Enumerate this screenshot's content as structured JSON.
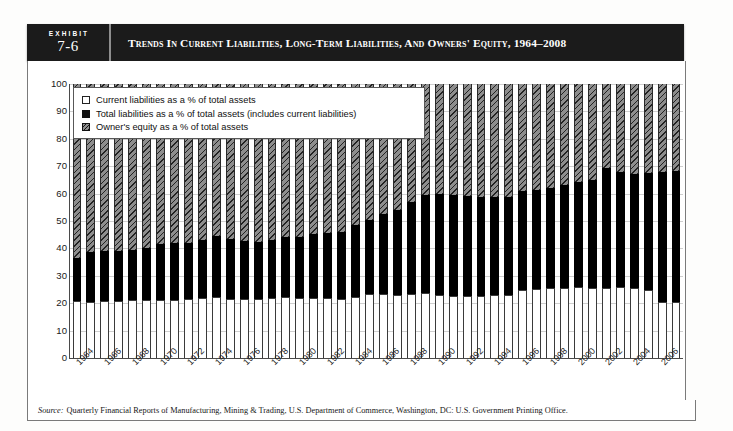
{
  "exhibit": {
    "kicker": "EXHIBIT",
    "number": "7-6",
    "title": "Trends in Current Liabilities, Long-Term Liabilities, and Owners' Equity, 1964–2008"
  },
  "source": {
    "label": "Source:",
    "text": "Quarterly Financial Reports of Manufacturing, Mining & Trading, U.S. Department of Commerce, Washington, DC: U.S. Government Printing Office."
  },
  "legend": {
    "items": [
      {
        "swatch": "white-square-icon",
        "label": "Current liabilities as a % of total assets"
      },
      {
        "swatch": "black-square-icon",
        "label": "Total liabilities as a % of total assets (includes current liabilities)"
      },
      {
        "swatch": "hatched-square-icon",
        "label": "Owner's equity as a % of total assets"
      }
    ]
  },
  "colors": {
    "header_bg": "#1b1b1b",
    "current_liabilities": "#ffffff",
    "total_liabilities": "#000000",
    "owners_equity": "#8d8d8d",
    "gridline": "#cfcfcf",
    "axis": "#4a4a4a"
  },
  "chart_data": {
    "type": "bar",
    "stacked": true,
    "title": "Trends in Current Liabilities, Long-Term Liabilities, and Owners' Equity, 1964–2008",
    "xlabel": "",
    "ylabel": "",
    "ylim": [
      0,
      100
    ],
    "yticks": [
      0,
      10,
      20,
      30,
      40,
      50,
      60,
      70,
      80,
      90,
      100
    ],
    "grid": true,
    "legend_position": "top-left",
    "x": [
      1964,
      1965,
      1966,
      1967,
      1968,
      1969,
      1970,
      1971,
      1972,
      1973,
      1974,
      1975,
      1976,
      1977,
      1978,
      1979,
      1980,
      1981,
      1982,
      1983,
      1984,
      1985,
      1986,
      1987,
      1988,
      1989,
      1990,
      1991,
      1992,
      1993,
      1994,
      1995,
      1996,
      1997,
      1998,
      1999,
      2000,
      2001,
      2002,
      2003,
      2004,
      2005,
      2006,
      2007
    ],
    "xtick_labels": [
      "1964",
      "1966",
      "1968",
      "1970",
      "1972",
      "1974",
      "1976",
      "1978",
      "1980",
      "1982",
      "1984",
      "1986",
      "1988",
      "1990",
      "1992",
      "1994",
      "1996",
      "1998",
      "2000",
      "2002",
      "2004",
      "2006"
    ],
    "series": [
      {
        "name": "Current liabilities as a % of total assets",
        "key": "current_liabilities",
        "values": [
          20.8,
          20.6,
          20.8,
          20.8,
          21.0,
          21.2,
          21.2,
          21.0,
          21.4,
          22.0,
          22.2,
          21.4,
          21.4,
          21.6,
          21.8,
          22.2,
          22.0,
          22.0,
          21.8,
          21.6,
          22.4,
          23.2,
          23.2,
          23.0,
          23.4,
          23.6,
          23.0,
          22.6,
          22.6,
          22.8,
          23.0,
          23.0,
          25.0,
          25.2,
          25.4,
          25.6,
          26.0,
          25.6,
          25.6,
          25.8,
          25.4,
          24.8,
          20.6,
          20.4
        ]
      },
      {
        "name": "Total liabilities as a % of total assets (includes current liabilities)",
        "key": "total_liabilities",
        "values": [
          36.4,
          38.8,
          39.0,
          39.2,
          39.4,
          40.2,
          41.6,
          41.8,
          42.0,
          43.0,
          44.4,
          43.6,
          42.6,
          42.4,
          43.0,
          44.0,
          44.2,
          45.4,
          45.8,
          46.0,
          48.6,
          50.2,
          52.6,
          54.2,
          57.0,
          59.6,
          60.0,
          59.4,
          59.0,
          58.6,
          58.6,
          58.8,
          60.8,
          61.4,
          62.2,
          63.2,
          64.4,
          65.0,
          69.2,
          68.0,
          67.2,
          67.4,
          68.0,
          68.4
        ]
      },
      {
        "name": "Owner's equity as a % of total assets",
        "key": "owners_equity",
        "values": [
          63.6,
          61.2,
          61.0,
          60.8,
          60.6,
          59.8,
          58.4,
          58.2,
          58.0,
          57.0,
          55.6,
          56.4,
          57.4,
          57.6,
          57.0,
          56.0,
          55.8,
          54.6,
          54.2,
          54.0,
          51.4,
          49.8,
          47.4,
          45.8,
          43.0,
          40.4,
          40.0,
          40.6,
          41.0,
          41.4,
          41.4,
          41.2,
          39.2,
          38.6,
          37.8,
          36.8,
          35.6,
          35.0,
          30.8,
          32.0,
          32.8,
          32.6,
          32.0,
          31.6
        ]
      }
    ]
  }
}
